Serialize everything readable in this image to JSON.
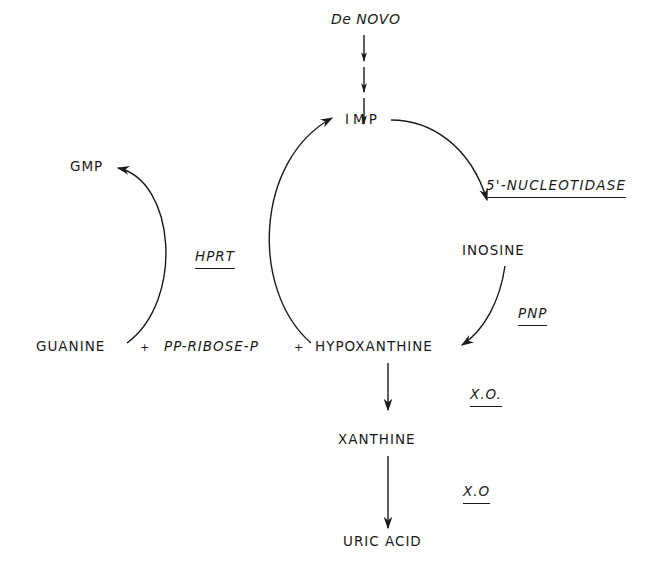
{
  "diagram": {
    "title": "",
    "type": "purine salvage and degradation pathway",
    "nodes": {
      "de_novo": "De NOVO",
      "imp": "IMP",
      "inosine": "INOSINE",
      "hypoxanthine": "HYPOXANTHINE",
      "xanthine": "XANTHINE",
      "uric_acid": "URIC ACID",
      "guanine": "GUANINE",
      "pp_ribose_p": "PP-RIBOSE-P",
      "gmp": "GMP"
    },
    "operators": {
      "plus1": "+",
      "plus2": "+"
    },
    "enzymes": {
      "nucleotidase": "5'-NUCLEOTIDASE",
      "pnp": "PNP",
      "hprt": "HPRT",
      "xo1": "X.O.",
      "xo2": "X.O"
    },
    "edges": [
      {
        "from": "De NOVO",
        "to": "IMP",
        "style": "multi-step dashed arrows"
      },
      {
        "from": "IMP",
        "to": "INOSINE",
        "enzyme": "5'-NUCLEOTIDASE"
      },
      {
        "from": "INOSINE",
        "to": "HYPOXANTHINE",
        "enzyme": "PNP"
      },
      {
        "from": "HYPOXANTHINE",
        "to": "IMP",
        "enzyme": "HPRT"
      },
      {
        "from": "GUANINE",
        "to": "GMP",
        "enzyme": "HPRT"
      },
      {
        "from": "HYPOXANTHINE",
        "to": "XANTHINE",
        "enzyme": "X.O."
      },
      {
        "from": "XANTHINE",
        "to": "URIC ACID",
        "enzyme": "X.O"
      }
    ],
    "colors": {
      "ink": "#1a1a1a",
      "background": "#ffffff"
    }
  }
}
